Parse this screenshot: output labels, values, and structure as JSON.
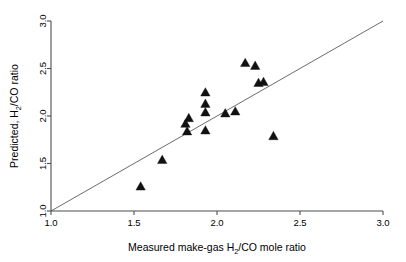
{
  "chart_data": {
    "type": "scatter",
    "title": "",
    "xlabel": "Measured make-gas H2/CO mole ratio",
    "xlabel_parts": {
      "pre": "Measured make-gas H",
      "sub": "2",
      "post": "/CO mole ratio"
    },
    "ylabel": "Predicted, H2/CO ratio",
    "ylabel_parts": {
      "pre": "Predicted, H",
      "sub": "2",
      "post": "/CO ratio"
    },
    "xlim": [
      1.0,
      3.0
    ],
    "ylim": [
      1.0,
      3.0
    ],
    "xticks": [
      "1.0",
      "1.5",
      "2.0",
      "2.5",
      "3.0"
    ],
    "xtick_values": [
      1.0,
      1.5,
      2.0,
      2.5,
      3.0
    ],
    "yticks": [
      "1.0",
      "1.5",
      "2.0",
      "2.5",
      "3.0"
    ],
    "ytick_values": [
      1.0,
      1.5,
      2.0,
      2.5,
      3.0
    ],
    "grid": false,
    "legend": null,
    "marker": "triangle-up",
    "marker_color": "#111111",
    "reference_line": {
      "name": "identity-line",
      "from": [
        1.0,
        1.0
      ],
      "to": [
        3.0,
        3.0
      ],
      "color": "#5a5a5a"
    },
    "points": [
      {
        "x": 1.54,
        "y": 1.26
      },
      {
        "x": 1.67,
        "y": 1.54
      },
      {
        "x": 1.81,
        "y": 1.92
      },
      {
        "x": 1.82,
        "y": 1.84
      },
      {
        "x": 1.83,
        "y": 1.98
      },
      {
        "x": 1.93,
        "y": 1.85
      },
      {
        "x": 1.93,
        "y": 2.04
      },
      {
        "x": 1.93,
        "y": 2.13
      },
      {
        "x": 1.93,
        "y": 2.25
      },
      {
        "x": 2.05,
        "y": 2.03
      },
      {
        "x": 2.11,
        "y": 2.05
      },
      {
        "x": 2.17,
        "y": 2.56
      },
      {
        "x": 2.23,
        "y": 2.53
      },
      {
        "x": 2.25,
        "y": 2.35
      },
      {
        "x": 2.28,
        "y": 2.36
      },
      {
        "x": 2.34,
        "y": 1.79
      }
    ]
  },
  "axes": {
    "x_axis_name": "x-axis",
    "y_axis_name": "y-axis"
  }
}
